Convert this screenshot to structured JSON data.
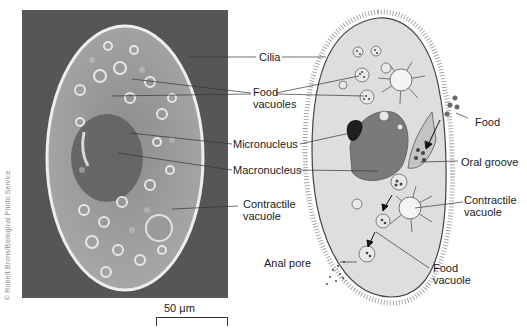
{
  "figure": {
    "credit": "© Robert Brons/Biological Photo Service",
    "scale_bar": "50 μm",
    "photo": {
      "background_color": "#565656",
      "cell_fill": "#9a9a9a",
      "cell_outline": "#e8e8e8"
    },
    "drawing": {
      "cell_fill": "#dedede",
      "nucleus_color": "#7a7a7a",
      "micronucleus_color": "#1e1e1e"
    }
  },
  "labels": {
    "cilia": "Cilia",
    "food_vacuoles_1": "Food",
    "food_vacuoles_2": "vacuoles",
    "micronucleus": "Micronucleus",
    "macronucleus": "Macronucleus",
    "contractile_left_1": "Contractile",
    "contractile_left_2": "vacuole",
    "food": "Food",
    "oral_groove": "Oral groove",
    "contractile_right_1": "Contractile",
    "contractile_right_2": "vacuole",
    "anal_pore": "Anal pore",
    "food_vacuole_1": "Food",
    "food_vacuole_2": "vacuole"
  }
}
